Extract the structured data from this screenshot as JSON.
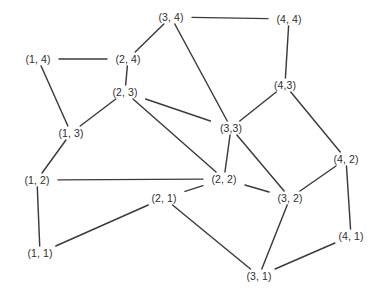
{
  "figure": {
    "type": "undirected-graph-diagram",
    "background_color": "#ffffff",
    "edge_color": "#3b3b3b",
    "label_color": "#2e2e2e",
    "width": 384,
    "height": 301
  },
  "graph": {
    "nodes": [
      {
        "id": "1_4",
        "label": "(1, 4)",
        "x": 38,
        "y": 59
      },
      {
        "id": "2_4",
        "label": "(2, 4)",
        "x": 128,
        "y": 59
      },
      {
        "id": "3_4",
        "label": "(3, 4)",
        "x": 171,
        "y": 17
      },
      {
        "id": "4_4",
        "label": "(4, 4)",
        "x": 289,
        "y": 19
      },
      {
        "id": "2_3",
        "label": "(2, 3)",
        "x": 125,
        "y": 92
      },
      {
        "id": "1_3",
        "label": "(1, 3)",
        "x": 71,
        "y": 133
      },
      {
        "id": "3_3",
        "label": "(3,3)",
        "x": 231,
        "y": 128
      },
      {
        "id": "4_3",
        "label": "(4,3)",
        "x": 285,
        "y": 85
      },
      {
        "id": "1_2",
        "label": "(1, 2)",
        "x": 37,
        "y": 180
      },
      {
        "id": "2_2",
        "label": "(2, 2)",
        "x": 224,
        "y": 179
      },
      {
        "id": "3_2",
        "label": "(3, 2)",
        "x": 290,
        "y": 198
      },
      {
        "id": "4_2",
        "label": "(4, 2)",
        "x": 346,
        "y": 159
      },
      {
        "id": "2_1",
        "label": "(2, 1)",
        "x": 164,
        "y": 198
      },
      {
        "id": "1_1",
        "label": "(1, 1)",
        "x": 40,
        "y": 253
      },
      {
        "id": "3_1",
        "label": "(3, 1)",
        "x": 259,
        "y": 276
      },
      {
        "id": "4_1",
        "label": "(4, 1)",
        "x": 351,
        "y": 236
      }
    ],
    "edges": [
      {
        "from": "1_4",
        "to": "2_4"
      },
      {
        "from": "1_4",
        "to": "1_3"
      },
      {
        "from": "2_4",
        "to": "3_4"
      },
      {
        "from": "2_4",
        "to": "2_3"
      },
      {
        "from": "3_4",
        "to": "4_4"
      },
      {
        "from": "3_4",
        "to": "3_3"
      },
      {
        "from": "4_4",
        "to": "4_3"
      },
      {
        "from": "4_3",
        "to": "3_3"
      },
      {
        "from": "4_3",
        "to": "4_2"
      },
      {
        "from": "2_3",
        "to": "1_3"
      },
      {
        "from": "2_3",
        "to": "3_3"
      },
      {
        "from": "2_3",
        "to": "2_2"
      },
      {
        "from": "1_3",
        "to": "1_2"
      },
      {
        "from": "3_3",
        "to": "2_2"
      },
      {
        "from": "3_3",
        "to": "3_2"
      },
      {
        "from": "1_2",
        "to": "2_2"
      },
      {
        "from": "1_2",
        "to": "1_1"
      },
      {
        "from": "2_2",
        "to": "3_2"
      },
      {
        "from": "2_2",
        "to": "2_1"
      },
      {
        "from": "3_2",
        "to": "4_2"
      },
      {
        "from": "3_2",
        "to": "3_1"
      },
      {
        "from": "4_2",
        "to": "4_1"
      },
      {
        "from": "2_1",
        "to": "1_1"
      },
      {
        "from": "2_1",
        "to": "3_1"
      },
      {
        "from": "3_1",
        "to": "4_1"
      }
    ]
  }
}
